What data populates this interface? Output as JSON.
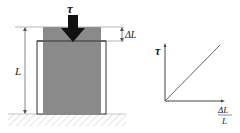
{
  "figure": {
    "load_symbol": "τ",
    "length_label": "L",
    "delta_label": "ΔL",
    "graph": {
      "y_axis_label": "τ",
      "x_axis_label_numerator": "ΔL",
      "x_axis_label_denominator": "L"
    },
    "colors": {
      "block": "#8a8a8a",
      "arrow": "#111111",
      "line": "#555555"
    }
  }
}
